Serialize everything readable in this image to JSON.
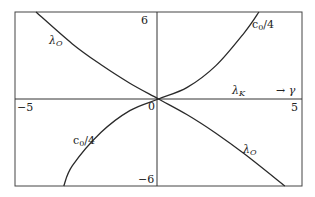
{
  "chart_data": {
    "type": "line",
    "title": "",
    "xlabel": "→ γ",
    "ylabel": "",
    "xlim": [
      -5,
      5
    ],
    "ylim": [
      -6,
      6
    ],
    "grid": false,
    "x_tick_labels": [
      "-5",
      "0",
      "5"
    ],
    "y_tick_labels": [
      "6",
      "-6"
    ],
    "annotations": [
      "λO",
      "c0/4",
      "λK",
      "→ γ"
    ],
    "series": [
      {
        "name": "λO",
        "x": [
          -4.27,
          -3,
          -2,
          -1,
          0,
          1,
          2,
          3,
          4.4
        ],
        "y": [
          6.0,
          3.8,
          2.36,
          1.09,
          0,
          -1.09,
          -2.36,
          -3.8,
          -6.0
        ]
      },
      {
        "name": "c0/4",
        "x": [
          -3.3,
          -3,
          -2,
          -1,
          0,
          1,
          2,
          3,
          3.5
        ],
        "y": [
          -6.0,
          -4.6,
          -2.3,
          -0.8,
          0,
          0.8,
          2.3,
          4.6,
          6.0
        ]
      },
      {
        "name": "λK",
        "x": [
          -5,
          0,
          5
        ],
        "y": [
          0,
          0,
          0
        ]
      }
    ]
  },
  "labels": {
    "y_top": "6",
    "y_bottom": "-6",
    "x_left": "−5",
    "x_right": "5",
    "origin": "0",
    "lambda_o_upper": "λ",
    "lambda_o_upper_sub": "O",
    "lambda_o_lower": "λ",
    "lambda_o_lower_sub": "O",
    "c0_upper": "c",
    "c0_upper_sub": "0",
    "c0_upper_rest": "/4",
    "c0_lower": "c",
    "c0_lower_sub": "0",
    "c0_lower_rest": "/4",
    "lambda_k": "λ",
    "lambda_k_sub": "K",
    "x_axis_arrow": "→ γ",
    "y_top_label_neg": "−6"
  },
  "colors": {
    "line": "#2a2a2a",
    "frame": "#444444",
    "background": "#ffffff"
  }
}
